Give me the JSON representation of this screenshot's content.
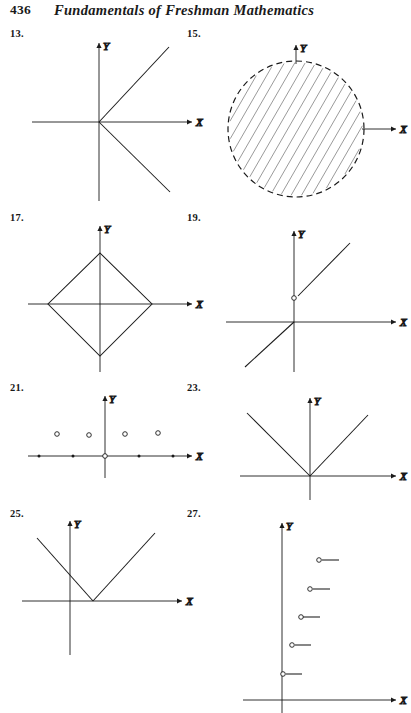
{
  "header": {
    "page_number": "436",
    "title": "Fundamentals of Freshman Mathematics"
  },
  "axis_labels": {
    "x": "X",
    "y": "Y"
  },
  "figures": [
    {
      "number": "13.",
      "label_x": 10,
      "label_y": 28,
      "origin": {
        "x": 99,
        "y": 122
      },
      "description": "two straight lines through the origin forming a sideways V opening to the right",
      "x_axis": {
        "x1": 32,
        "x2": 192,
        "arrow": "right"
      },
      "y_axis": {
        "y1": 43,
        "y2": 201,
        "arrow": "up"
      },
      "strokes": [
        {
          "kind": "segment",
          "x1": 99,
          "y1": 122,
          "x2": 169,
          "y2": 47
        },
        {
          "kind": "segment",
          "x1": 99,
          "y1": 122,
          "x2": 170,
          "y2": 192
        }
      ],
      "points": []
    },
    {
      "number": "15.",
      "label_x": 187,
      "label_y": 28,
      "origin": {
        "x": 296,
        "y": 129
      },
      "description": "dashed circle centered at the origin with diagonal hatching filling the interior",
      "x_axis": {
        "x1": 362,
        "x2": 396,
        "arrow": "right"
      },
      "y_axis": {
        "y1": 45,
        "y2": 64,
        "arrow": "up"
      },
      "strokes": [
        {
          "kind": "dashed-circle",
          "cx": 296,
          "cy": 129,
          "r": 68
        },
        {
          "kind": "hatch-fill",
          "cx": 296,
          "cy": 129,
          "r": 68,
          "angle": -60,
          "spacing": 9
        }
      ],
      "points": []
    },
    {
      "number": "17.",
      "label_x": 10,
      "label_y": 212,
      "origin": {
        "x": 100,
        "y": 304
      },
      "description": "a diamond (rhombus) centered at the origin with its four vertices on the axes",
      "x_axis": {
        "x1": 28,
        "x2": 192,
        "arrow": "right"
      },
      "y_axis": {
        "y1": 226,
        "y2": 372,
        "arrow": "up"
      },
      "strokes": [
        {
          "kind": "polygon",
          "pts": "100,253 152,304 100,356 48,304"
        }
      ],
      "points": []
    },
    {
      "number": "19.",
      "label_x": 187,
      "label_y": 212,
      "origin": {
        "x": 294,
        "y": 322
      },
      "description": "a ray beginning at an open circle above the origin rising to the right, plus a separate line through the origin descending to the lower left",
      "x_axis": {
        "x1": 226,
        "x2": 396,
        "arrow": "right"
      },
      "y_axis": {
        "y1": 231,
        "y2": 372,
        "arrow": "up"
      },
      "strokes": [
        {
          "kind": "segment",
          "x1": 298,
          "y1": 296,
          "x2": 350,
          "y2": 243
        },
        {
          "kind": "segment",
          "x1": 294,
          "y1": 322,
          "x2": 245,
          "y2": 367
        }
      ],
      "points": [
        {
          "kind": "open",
          "x": 294,
          "y": 298
        }
      ]
    },
    {
      "number": "21.",
      "label_x": 10,
      "label_y": 382,
      "origin": {
        "x": 105,
        "y": 456
      },
      "description": "a discrete set: four small open circles above the x-axis and five dots lying on the x-axis",
      "x_axis": {
        "x1": 28,
        "x2": 192,
        "arrow": "right"
      },
      "y_axis": {
        "y1": 396,
        "y2": 478,
        "arrow": "up"
      },
      "strokes": [],
      "points": [
        {
          "kind": "open",
          "x": 57,
          "y": 434
        },
        {
          "kind": "open",
          "x": 89,
          "y": 435
        },
        {
          "kind": "open",
          "x": 125,
          "y": 434
        },
        {
          "kind": "open",
          "x": 158,
          "y": 433
        },
        {
          "kind": "dot",
          "x": 39,
          "y": 456
        },
        {
          "kind": "dot",
          "x": 73,
          "y": 456
        },
        {
          "kind": "open",
          "x": 105,
          "y": 456
        },
        {
          "kind": "dot",
          "x": 139,
          "y": 456
        },
        {
          "kind": "dot",
          "x": 173,
          "y": 456
        }
      ]
    },
    {
      "number": "23.",
      "label_x": 187,
      "label_y": 382,
      "origin": {
        "x": 310,
        "y": 476
      },
      "description": "a V-shaped absolute-value graph with its vertex at the origin",
      "x_axis": {
        "x1": 240,
        "x2": 396,
        "arrow": "right"
      },
      "y_axis": {
        "y1": 398,
        "y2": 500,
        "arrow": "up"
      },
      "strokes": [
        {
          "kind": "segment",
          "x1": 310,
          "y1": 476,
          "x2": 247,
          "y2": 413
        },
        {
          "kind": "segment",
          "x1": 310,
          "y1": 476,
          "x2": 368,
          "y2": 415
        }
      ],
      "points": []
    },
    {
      "number": "25.",
      "label_x": 10,
      "label_y": 508,
      "origin": {
        "x": 70,
        "y": 601
      },
      "description": "a V-shaped graph whose vertex sits on the x-axis to the right of the origin",
      "x_axis": {
        "x1": 22,
        "x2": 182,
        "arrow": "right"
      },
      "y_axis": {
        "y1": 521,
        "y2": 655,
        "arrow": "up"
      },
      "strokes": [
        {
          "kind": "segment",
          "x1": 93,
          "y1": 601,
          "x2": 37,
          "y2": 538
        },
        {
          "kind": "segment",
          "x1": 93,
          "y1": 601,
          "x2": 155,
          "y2": 533
        }
      ],
      "points": []
    },
    {
      "number": "27.",
      "label_x": 187,
      "label_y": 508,
      "origin": {
        "x": 282,
        "y": 700
      },
      "description": "an ascending step function of five short horizontal segments, each beginning with an open circle",
      "x_axis": {
        "x1": 243,
        "x2": 396,
        "arrow": "right"
      },
      "y_axis": {
        "y1": 523,
        "y2": 713,
        "arrow": "up"
      },
      "strokes": [
        {
          "kind": "segment",
          "x1": 286,
          "y1": 674,
          "x2": 302,
          "y2": 674
        },
        {
          "kind": "segment",
          "x1": 295,
          "y1": 645,
          "x2": 311,
          "y2": 645
        },
        {
          "kind": "segment",
          "x1": 303,
          "y1": 617,
          "x2": 320,
          "y2": 617
        },
        {
          "kind": "segment",
          "x1": 313,
          "y1": 589,
          "x2": 330,
          "y2": 589
        },
        {
          "kind": "segment",
          "x1": 322,
          "y1": 560,
          "x2": 339,
          "y2": 560
        }
      ],
      "points": [
        {
          "kind": "open",
          "x": 283,
          "y": 674
        },
        {
          "kind": "open",
          "x": 292,
          "y": 645
        },
        {
          "kind": "open",
          "x": 301,
          "y": 617
        },
        {
          "kind": "open",
          "x": 310,
          "y": 589
        },
        {
          "kind": "open",
          "x": 319,
          "y": 560
        }
      ]
    }
  ]
}
